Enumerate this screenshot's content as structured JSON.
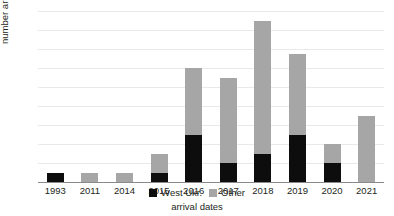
{
  "chart_data": {
    "type": "bar",
    "subtype": "stacked-bar",
    "title": "",
    "xlabel": "arrival dates",
    "ylabel": "number arriving",
    "categories": [
      "1993",
      "2011",
      "2014",
      "2015",
      "2016",
      "2017",
      "2018",
      "2019",
      "2020",
      "2021"
    ],
    "series": [
      {
        "name": "West Ukr.",
        "color": "#0d0d0d",
        "values": [
          1,
          0,
          0,
          1,
          5,
          2,
          3,
          5,
          2,
          0
        ]
      },
      {
        "name": "Other",
        "color": "#a6a6a6",
        "values": [
          0,
          1,
          1,
          2,
          7,
          9,
          14,
          8.5,
          2,
          7
        ]
      }
    ],
    "totals": [
      1,
      1,
      1,
      3,
      12,
      11,
      17,
      13.5,
      4,
      7
    ],
    "ylim": [
      0,
      18
    ],
    "ytick_values": [
      0,
      2,
      4,
      6,
      8,
      10,
      12,
      14,
      16,
      18
    ],
    "ytick_labels": [
      "0",
      "2",
      "4",
      "6",
      "8",
      "10",
      "12",
      "14",
      "16",
      "18"
    ],
    "grid": true,
    "grid_axis": "y",
    "legend_position": "bottom-center",
    "legend_entries": [
      "West Ukr.",
      "Other"
    ]
  }
}
